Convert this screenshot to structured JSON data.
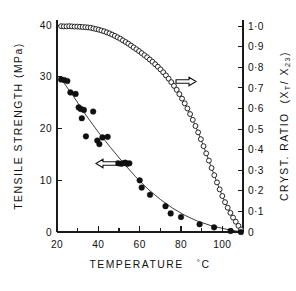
{
  "chart_data": {
    "type": "scatter",
    "title": "",
    "xlabel": "TEMPERATURE  °C",
    "ylabel_left": "TENSILE  STRENGTH  (MPa)",
    "ylabel_right": "CRYST. RATIO  (Xₜ / X₂₃)",
    "xlim": [
      20,
      110
    ],
    "ylim_left": [
      0,
      41
    ],
    "ylim_right": [
      0,
      1.03
    ],
    "grid": false,
    "legend": "none",
    "x_major_ticks": [
      20,
      40,
      60,
      80,
      100
    ],
    "x_minor_ticks": [
      30,
      50,
      70,
      90,
      110
    ],
    "x_tick_labels": [
      "20",
      "40",
      "60",
      "80",
      "100"
    ],
    "y_left_ticks": [
      0,
      10,
      20,
      30,
      40
    ],
    "y_left_tick_labels": [
      "0",
      "10",
      "20",
      "30",
      "40"
    ],
    "y_right_ticks": [
      0,
      0.1,
      0.2,
      0.3,
      0.4,
      0.5,
      0.6,
      0.7,
      0.8,
      0.9,
      1.0
    ],
    "y_right_tick_labels": [
      "0",
      "0·1",
      "0·2",
      "0·3",
      "0·4",
      "0·5",
      "0·6",
      "0·7",
      "0·8",
      "0·9",
      "1·0"
    ],
    "annotations": [
      {
        "name": "left-arrow",
        "text": "←",
        "points_to": "left-axis",
        "x": 48,
        "y": 14.5
      },
      {
        "name": "right-arrow",
        "text": "→",
        "points_to": "right-axis",
        "x": 82,
        "y": 0.745
      }
    ],
    "series": [
      {
        "name": "Tensile strength",
        "marker": "filled-circle",
        "axis": "left",
        "points": [
          [
            22.0,
            29.5
          ],
          [
            23.5,
            29.4
          ],
          [
            25.0,
            29.2
          ],
          [
            26.5,
            27.0
          ],
          [
            29.0,
            26.7
          ],
          [
            30.5,
            24.1
          ],
          [
            31.5,
            23.8
          ],
          [
            32.0,
            22.0
          ],
          [
            33.0,
            23.6
          ],
          [
            34.0,
            18.5
          ],
          [
            37.5,
            23.3
          ],
          [
            39.5,
            17.7
          ],
          [
            40.5,
            17.0
          ],
          [
            42.0,
            18.3
          ],
          [
            44.5,
            18.4
          ],
          [
            49.5,
            13.3
          ],
          [
            51.0,
            13.2
          ],
          [
            52.0,
            13.3
          ],
          [
            53.0,
            13.4
          ],
          [
            54.0,
            13.2
          ],
          [
            55.0,
            13.3
          ],
          [
            60.0,
            10.0
          ],
          [
            61.0,
            8.6
          ],
          [
            65.0,
            7.2
          ],
          [
            72.5,
            5.0
          ],
          [
            75.0,
            3.6
          ],
          [
            80.0,
            2.9
          ],
          [
            89.0,
            1.5
          ],
          [
            96.0,
            0.9
          ],
          [
            104.0,
            0.2
          ],
          [
            109.0,
            0.0
          ]
        ],
        "fit_curve": [
          [
            22,
            29.6
          ],
          [
            28,
            26.2
          ],
          [
            34,
            22.6
          ],
          [
            40,
            19.3
          ],
          [
            46,
            16.3
          ],
          [
            52,
            13.4
          ],
          [
            58,
            10.7
          ],
          [
            64,
            8.3
          ],
          [
            70,
            6.3
          ],
          [
            76,
            4.6
          ],
          [
            82,
            3.2
          ],
          [
            88,
            2.1
          ],
          [
            94,
            1.3
          ],
          [
            100,
            0.7
          ],
          [
            105,
            0.3
          ],
          [
            109,
            0.05
          ]
        ]
      },
      {
        "name": "Crystallinity ratio",
        "marker": "open-circle",
        "axis": "right",
        "points": [
          [
            22.0,
            1.0
          ],
          [
            23.3,
            0.999
          ],
          [
            24.6,
            0.999
          ],
          [
            25.9,
            1.0
          ],
          [
            27.2,
            0.999
          ],
          [
            28.5,
            0.998
          ],
          [
            29.8,
            0.998
          ],
          [
            31.1,
            0.997
          ],
          [
            32.4,
            0.996
          ],
          [
            33.7,
            0.995
          ],
          [
            35.0,
            0.994
          ],
          [
            36.3,
            0.992
          ],
          [
            37.6,
            0.989
          ],
          [
            38.9,
            0.986
          ],
          [
            40.2,
            0.983
          ],
          [
            41.5,
            0.979
          ],
          [
            42.8,
            0.975
          ],
          [
            44.1,
            0.97
          ],
          [
            45.4,
            0.965
          ],
          [
            46.7,
            0.959
          ],
          [
            48.0,
            0.953
          ],
          [
            49.3,
            0.946
          ],
          [
            50.6,
            0.939
          ],
          [
            51.9,
            0.931
          ],
          [
            53.2,
            0.923
          ],
          [
            54.5,
            0.915
          ],
          [
            55.8,
            0.906
          ],
          [
            57.1,
            0.897
          ],
          [
            58.4,
            0.888
          ],
          [
            59.7,
            0.879
          ],
          [
            61.0,
            0.869
          ],
          [
            62.3,
            0.859
          ],
          [
            63.6,
            0.849
          ],
          [
            64.9,
            0.838
          ],
          [
            66.2,
            0.827
          ],
          [
            67.5,
            0.815
          ],
          [
            68.8,
            0.803
          ],
          [
            70.1,
            0.79
          ],
          [
            71.4,
            0.776
          ],
          [
            72.7,
            0.761
          ],
          [
            74.0,
            0.745
          ],
          [
            75.3,
            0.728
          ],
          [
            76.6,
            0.71
          ],
          [
            77.9,
            0.691
          ],
          [
            79.2,
            0.67
          ],
          [
            80.5,
            0.648
          ],
          [
            81.8,
            0.625
          ],
          [
            83.1,
            0.6
          ],
          [
            84.4,
            0.573
          ],
          [
            85.7,
            0.545
          ],
          [
            87.0,
            0.515
          ],
          [
            88.3,
            0.484
          ],
          [
            89.6,
            0.451
          ],
          [
            90.9,
            0.417
          ],
          [
            92.2,
            0.382
          ],
          [
            93.5,
            0.347
          ],
          [
            94.8,
            0.311
          ],
          [
            96.1,
            0.276
          ],
          [
            97.4,
            0.241
          ],
          [
            98.7,
            0.207
          ],
          [
            100.0,
            0.175
          ],
          [
            101.3,
            0.145
          ],
          [
            102.6,
            0.118
          ],
          [
            103.9,
            0.093
          ],
          [
            105.2,
            0.07
          ],
          [
            106.5,
            0.05
          ],
          [
            107.8,
            0.03
          ],
          [
            109.0,
            0.012
          ]
        ]
      }
    ]
  },
  "axes": {
    "left_title_parts": [
      "TENSILE",
      "STRENGTH",
      "(MPa)"
    ],
    "right_title_main": "CRYST. RATIO",
    "right_title_paren_open": "(X",
    "right_title_sub1": "T",
    "right_title_slash": "/ X",
    "right_title_sub2": "23",
    "right_title_paren_close": ")",
    "x_title_main": "TEMPERATURE",
    "x_title_unit_deg": "°",
    "x_title_unit_c": "C"
  }
}
